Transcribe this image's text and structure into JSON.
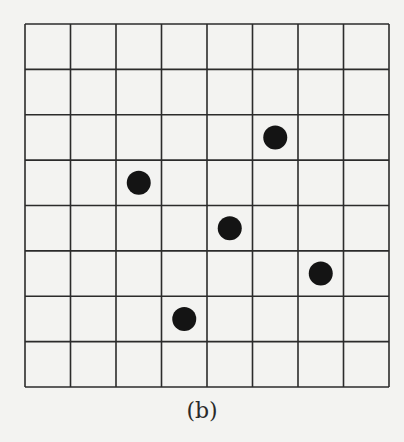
{
  "figure": {
    "caption": "(b)",
    "grid": {
      "rows": 8,
      "cols": 8,
      "left": 25,
      "top": 24,
      "right": 389,
      "bottom": 387,
      "line_color": "#2b2b2b",
      "line_width": 1.6
    },
    "dots": [
      {
        "row": 2,
        "col": 5
      },
      {
        "row": 3,
        "col": 2
      },
      {
        "row": 4,
        "col": 4
      },
      {
        "row": 5,
        "col": 6
      },
      {
        "row": 6,
        "col": 3
      }
    ],
    "dot_color": "#141414",
    "dot_radius": 12
  }
}
